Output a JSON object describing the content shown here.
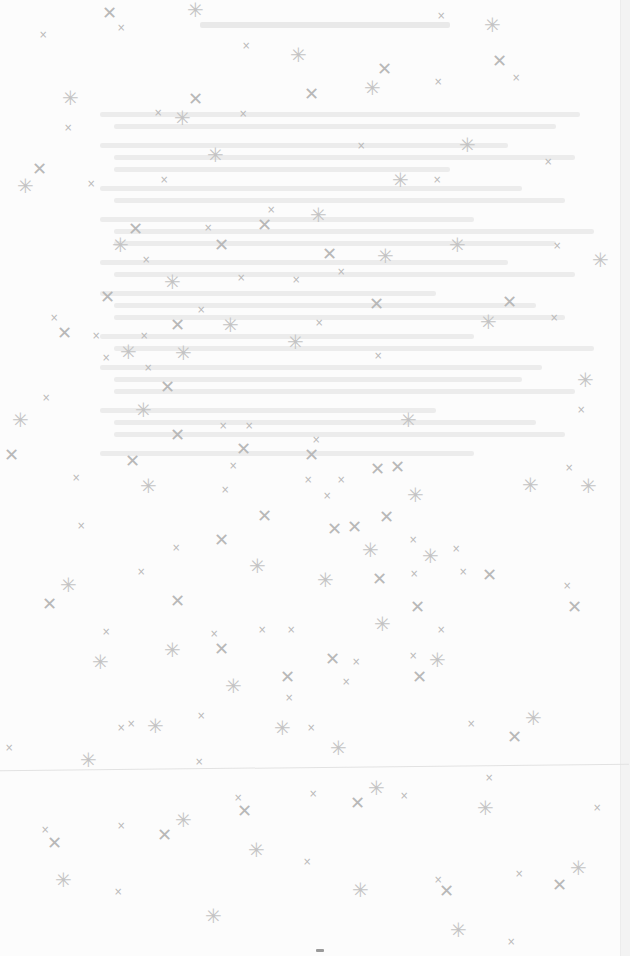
{
  "document": {
    "header_text": "",
    "list_items": [
      {
        "lines": 2
      },
      {
        "lines": 3
      },
      {
        "lines": 2
      },
      {
        "lines": 3
      },
      {
        "lines": 2
      },
      {
        "lines": 3
      },
      {
        "lines": 2
      },
      {
        "lines": 3
      },
      {
        "lines": 3
      },
      {
        "lines": 1
      }
    ]
  },
  "overlay": {
    "glyph_small": "×",
    "glyph_large": "✕",
    "glyph_star": "✳"
  },
  "colors": {
    "background": "#fcfcfc",
    "text_faded": "#ececec",
    "glyph": "#b8b8b8"
  }
}
